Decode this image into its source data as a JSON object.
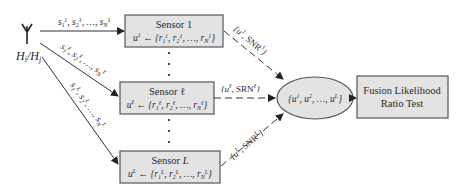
{
  "source": {
    "icon": "antenna-icon",
    "hypothesis_label": "H_i/H_j"
  },
  "sensors": [
    {
      "title": "Sensor 1",
      "decision_formula": "u¹ ← {r₁¹, r₂¹, …, r_N¹}",
      "input_label": "s₁¹, s₂¹, …, s_N¹",
      "output_label": "{u¹, SNR¹}"
    },
    {
      "title": "Sensor ℓ",
      "decision_formula": "uℓ ← {r₁ℓ, r₂ℓ, …, r_Nℓ}",
      "input_label": "s₁ℓ, s₂ℓ, …, s_Nℓ",
      "output_label": "{uℓ, SRNℓ}"
    },
    {
      "title": "Sensor L",
      "decision_formula": "uᴸ ← {r₁ᴸ, r₂ᴸ, …, r_Nᴸ}",
      "input_label": "s₁ᴸ, s₂ᴸ, …, s_Nᴸ",
      "output_label": "{uᴸ, SNRᴸ}"
    }
  ],
  "fusion_set": {
    "label": "{u¹, u², …, uᴸ}"
  },
  "fusion_test": {
    "line1": "Fusion Likelihood",
    "line2": "Ratio Test"
  },
  "colors": {
    "box_fill": "#e3e3e3",
    "stroke": "#333333"
  }
}
